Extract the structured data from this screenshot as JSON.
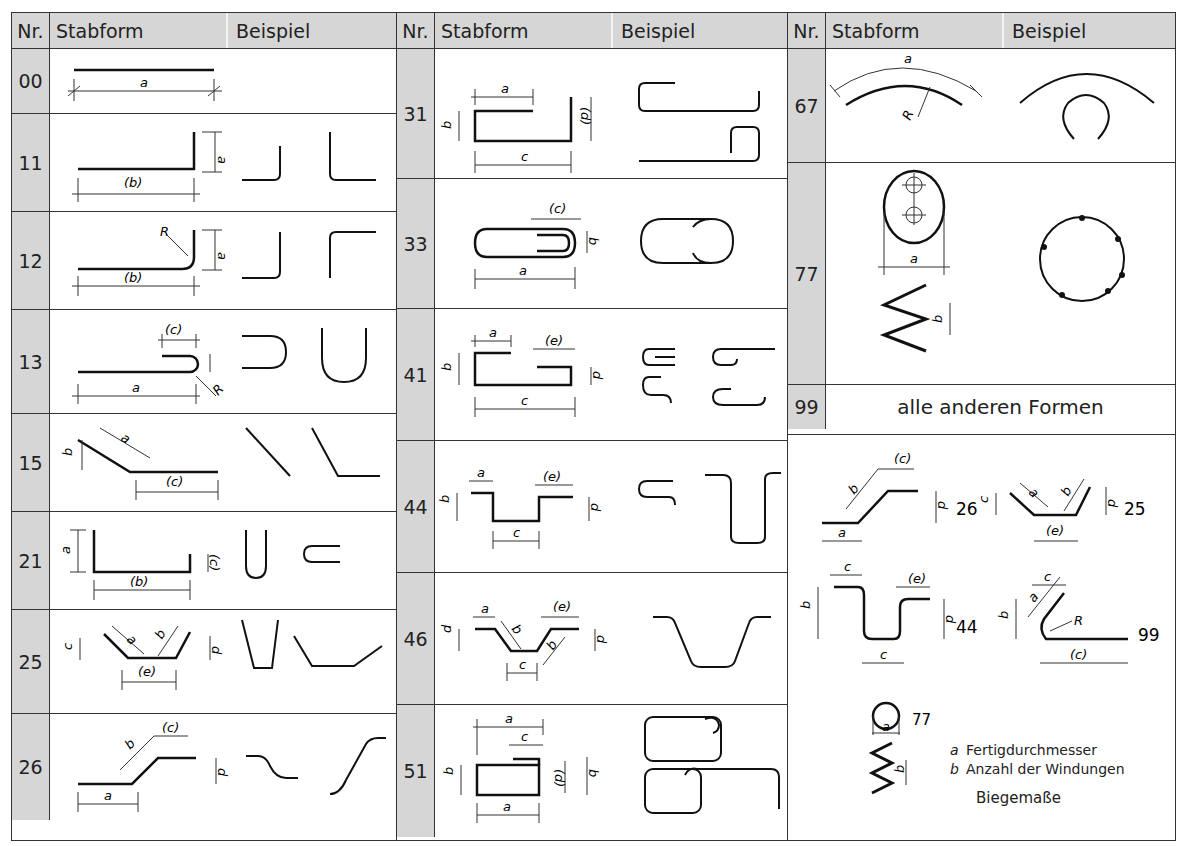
{
  "header": {
    "nr": "Nr.",
    "stabform": "Stabform",
    "beispiel": "Beispiel"
  },
  "column1": {
    "rows": [
      {
        "nr": "00"
      },
      {
        "nr": "11"
      },
      {
        "nr": "12"
      },
      {
        "nr": "13"
      },
      {
        "nr": "15"
      },
      {
        "nr": "21"
      },
      {
        "nr": "25"
      },
      {
        "nr": "26"
      }
    ]
  },
  "column2": {
    "rows": [
      {
        "nr": "31"
      },
      {
        "nr": "33"
      },
      {
        "nr": "41"
      },
      {
        "nr": "44"
      },
      {
        "nr": "46"
      },
      {
        "nr": "51"
      }
    ]
  },
  "column3": {
    "rows": [
      {
        "nr": "67"
      },
      {
        "nr": "77"
      },
      {
        "nr": "99",
        "text": "alle anderen Formen"
      }
    ]
  },
  "labels": {
    "a": "a",
    "b": "b",
    "c": "c",
    "d": "d",
    "e": "e",
    "R": "R",
    "pb": "(b)",
    "pc": "(c)",
    "pd": "(d)",
    "pe": "(e)"
  },
  "biegemasse": {
    "shape_ids": [
      "26",
      "25",
      "44",
      "99",
      "77"
    ],
    "legend": [
      {
        "key": "a",
        "text": "Fertigdurchmesser"
      },
      {
        "key": "b",
        "text": "Anzahl der Windungen"
      }
    ],
    "title": "Biegemaße"
  }
}
